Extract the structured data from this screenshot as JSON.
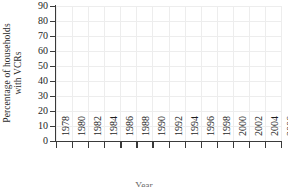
{
  "chart_data": {
    "type": "line",
    "title": "",
    "xlabel": "Year",
    "ylabel_line1": "Percentage of households",
    "ylabel_line2": "with VCRs",
    "xlim": [
      1978,
      2006
    ],
    "ylim": [
      0,
      90
    ],
    "grid": true,
    "legend": "none",
    "line_color": "#8c8c8c",
    "axis_color": "#3a3a3a",
    "grid_color": "#ededed",
    "background": "#ffffff",
    "ytick_labels": [
      "0",
      "10",
      "20",
      "30",
      "40",
      "50",
      "60",
      "70",
      "80",
      "90"
    ],
    "ytick_values": [
      0,
      10,
      20,
      30,
      40,
      50,
      60,
      70,
      80,
      90
    ],
    "xtick_labels": [
      "1978",
      "1980",
      "1982",
      "1984",
      "1986",
      "1988",
      "1990",
      "1992",
      "1994",
      "1996",
      "1998",
      "2000",
      "2002",
      "2004",
      "2006"
    ],
    "xtick_values": [
      1978,
      1980,
      1982,
      1984,
      1986,
      1988,
      1990,
      1992,
      1994,
      1996,
      1998,
      2000,
      2002,
      2004,
      2006
    ],
    "series": [
      {
        "name": "Percentage of households with VCRs",
        "x": [
          1978,
          1979,
          1980,
          1981,
          1982,
          1983,
          1984,
          1985,
          1986,
          1987,
          1988,
          1989,
          1990,
          1991,
          1992,
          1993,
          1994,
          1995,
          1996,
          1997,
          1998,
          1999,
          2000,
          2001,
          2002,
          2003,
          2004,
          2005,
          2006
        ],
        "values": [
          0.3,
          0.5,
          1.1,
          1.8,
          3.1,
          5.5,
          10.6,
          20.8,
          36.0,
          48.7,
          58.0,
          64.6,
          68.6,
          71.9,
          75.0,
          77.1,
          79.0,
          81.0,
          82.2,
          84.2,
          84.6,
          85.1,
          88.6,
          88.8,
          87.9,
          86.2,
          84.2,
          82.0,
          79.2
        ]
      }
    ]
  }
}
